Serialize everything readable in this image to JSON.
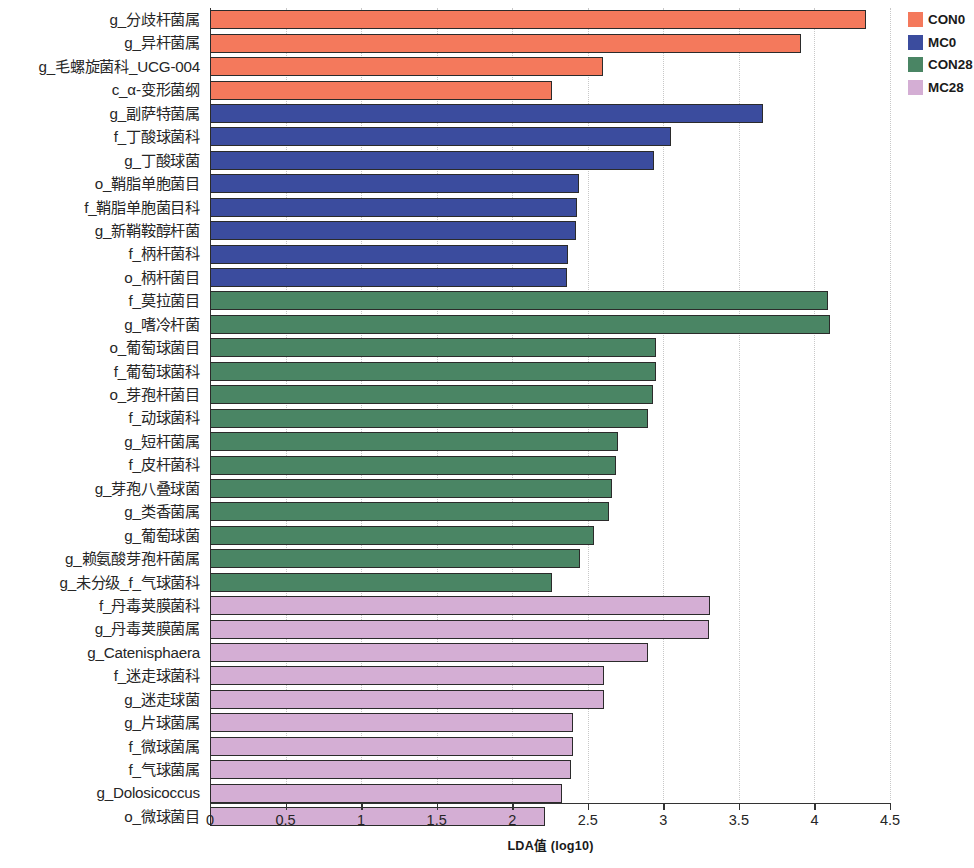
{
  "chart_data": {
    "type": "bar",
    "orientation": "horizontal",
    "title": "",
    "xlabel": "LDA值 (log10)",
    "ylabel": "",
    "xlim": [
      0,
      4.5
    ],
    "xticks": [
      "0",
      "0.5",
      "1",
      "1.5",
      "2",
      "2.5",
      "3",
      "3.5",
      "4",
      "4.5"
    ],
    "xtick_values": [
      0,
      0.5,
      1,
      1.5,
      2,
      2.5,
      3,
      3.5,
      4,
      4.5
    ],
    "grid": "vertical-dotted",
    "legend_position": "top-right",
    "legend": [
      {
        "name": "CON0",
        "color": "#F4795C"
      },
      {
        "name": "MC0",
        "color": "#3B4C9E"
      },
      {
        "name": "CON28",
        "color": "#4A8564"
      },
      {
        "name": "MC28",
        "color": "#D4AED4"
      }
    ],
    "categories": [
      "g_分歧杆菌属",
      "g_异杆菌属",
      "g_毛螺旋菌科_UCG-004",
      "c_α-变形菌纲",
      "g_副萨特菌属",
      "f_丁酸球菌科",
      "g_丁酸球菌",
      "o_鞘脂单胞菌目",
      "f_鞘脂单胞菌目科",
      "g_新鞘鞍醇杆菌",
      "f_柄杆菌科",
      "o_柄杆菌目",
      "f_莫拉菌目",
      "g_嗜冷杆菌",
      "o_葡萄球菌目",
      "f_葡萄球菌科",
      "o_芽孢杆菌目",
      "f_动球菌科",
      "g_短杆菌属",
      "f_皮杆菌科",
      "g_芽孢八叠球菌",
      "g_类香菌属",
      "g_葡萄球菌",
      "g_赖氨酸芽孢杆菌属",
      "g_未分级_f_气球菌科",
      "f_丹毒荚膜菌科",
      "g_丹毒荚膜菌属",
      "g_Catenisphaera",
      "f_迷走球菌科",
      "g_迷走球菌",
      "g_片球菌属",
      "f_微球菌属",
      "f_气球菌属",
      "g_Dolosicoccus",
      "o_微球菌目"
    ],
    "values": [
      4.34,
      3.91,
      2.6,
      2.26,
      3.66,
      3.05,
      2.94,
      2.44,
      2.43,
      2.42,
      2.37,
      2.36,
      4.09,
      4.1,
      2.95,
      2.95,
      2.93,
      2.9,
      2.7,
      2.69,
      2.66,
      2.64,
      2.54,
      2.45,
      2.26,
      3.31,
      3.3,
      2.9,
      2.61,
      2.61,
      2.4,
      2.4,
      2.39,
      2.33,
      2.22
    ],
    "groups": [
      "CON0",
      "CON0",
      "CON0",
      "CON0",
      "MC0",
      "MC0",
      "MC0",
      "MC0",
      "MC0",
      "MC0",
      "MC0",
      "MC0",
      "CON28",
      "CON28",
      "CON28",
      "CON28",
      "CON28",
      "CON28",
      "CON28",
      "CON28",
      "CON28",
      "CON28",
      "CON28",
      "CON28",
      "CON28",
      "MC28",
      "MC28",
      "MC28",
      "MC28",
      "MC28",
      "MC28",
      "MC28",
      "MC28",
      "MC28",
      "MC28"
    ]
  }
}
